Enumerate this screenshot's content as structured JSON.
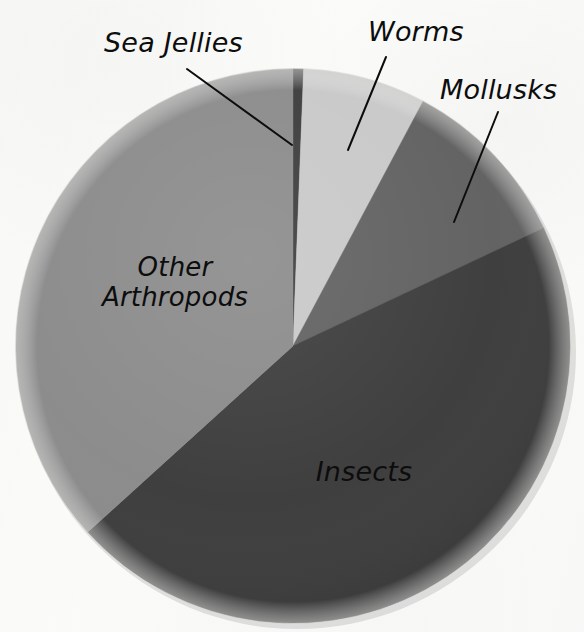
{
  "figure": {
    "title": "",
    "background_color": "#fbfbfa",
    "stroke_color": "#0d0d0d"
  },
  "labels": {
    "sea_jellies": "Sea Jellies",
    "worms": "Worms",
    "mollusks": "Mollusks",
    "other_arthropods_line1": "Other",
    "other_arthropods_line2": "Arthropods",
    "insects": "Insects"
  },
  "chart_data": {
    "type": "pie",
    "title": "",
    "xlabel": "",
    "ylabel": "",
    "legend_position": "none",
    "grid": false,
    "label_style": "callout-and-inline",
    "categories": [
      "Sea Jellies",
      "Worms",
      "Mollusks",
      "Insects",
      "Other Arthropods"
    ],
    "values": [
      0.6,
      7.2,
      10.2,
      45.3,
      36.7
    ],
    "units": "percent",
    "slices": [
      {
        "name": "Sea Jellies",
        "value": 0.6,
        "color": "#3a3a3a",
        "start_angle_deg": 0.0,
        "end_angle_deg": 2.2,
        "label_placement": "callout",
        "label_text": "Sea Jellies"
      },
      {
        "name": "Worms",
        "value": 7.2,
        "color": "#c8c8c8",
        "start_angle_deg": 2.2,
        "end_angle_deg": 28.0,
        "label_placement": "callout",
        "label_text": "Worms"
      },
      {
        "name": "Mollusks",
        "value": 10.2,
        "color": "#606060",
        "start_angle_deg": 28.0,
        "end_angle_deg": 64.8,
        "label_placement": "callout",
        "label_text": "Mollusks"
      },
      {
        "name": "Insects",
        "value": 45.3,
        "color": "#3a3a3a",
        "start_angle_deg": 64.8,
        "end_angle_deg": 227.8,
        "label_placement": "inside",
        "label_text": "Insects"
      },
      {
        "name": "Other Arthropods",
        "value": 36.7,
        "color": "#8a8a8a",
        "start_angle_deg": 227.8,
        "end_angle_deg": 360.0,
        "label_placement": "inside",
        "label_text": "Other Arthropods"
      }
    ],
    "geometry": {
      "center_x": 293,
      "center_y": 346,
      "radius": 277
    },
    "callouts": [
      {
        "name": "sea-jellies",
        "x1": 187,
        "y1": 69,
        "x2": 292,
        "y2": 145
      },
      {
        "name": "worms",
        "x1": 386,
        "y1": 57,
        "x2": 348,
        "y2": 150
      },
      {
        "name": "mollusks",
        "x1": 498,
        "y1": 112,
        "x2": 454,
        "y2": 222
      }
    ]
  }
}
